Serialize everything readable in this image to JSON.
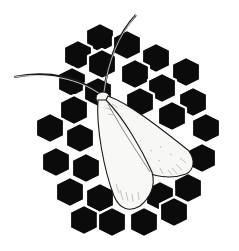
{
  "image": {
    "subject": "white moth resting on black honeycomb of hexagons",
    "background_color": "#ffffff",
    "hex_color": "#0b0b0b",
    "moth_color": "#f7f7f5",
    "outline_color": "#1a1a1a"
  }
}
